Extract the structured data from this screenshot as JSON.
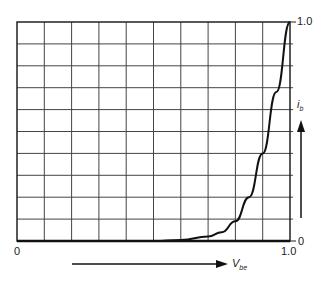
{
  "chart_data": {
    "type": "line",
    "title": "",
    "xlabel": "V_be",
    "ylabel": "i_b",
    "xlim": [
      0,
      1.0
    ],
    "ylim": [
      0,
      1.0
    ],
    "grid": true,
    "grid_divisions": {
      "x": 10,
      "y": 10
    },
    "x_tick_labels": [
      "0",
      "1.0"
    ],
    "y_tick_labels": [
      "0",
      "1.0"
    ],
    "series": [
      {
        "name": "i_b vs V_be (diode curve)",
        "x": [
          0.0,
          0.5,
          0.6,
          0.7,
          0.75,
          0.8,
          0.85,
          0.9,
          0.95,
          1.0
        ],
        "y": [
          0.0,
          0.0,
          0.005,
          0.02,
          0.04,
          0.09,
          0.2,
          0.4,
          0.68,
          1.0
        ]
      }
    ]
  },
  "labels": {
    "x_origin": "0",
    "x_max": "1.0",
    "y_origin": "0",
    "y_max": "1.0",
    "x_axis_name": "V",
    "x_axis_sub": "be",
    "y_axis_name": "i",
    "y_axis_sub": "b"
  }
}
